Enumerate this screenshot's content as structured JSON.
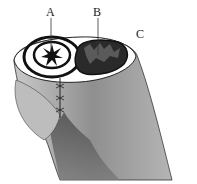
{
  "diagram": {
    "type": "anatomical cross-section illustration",
    "labels": [
      {
        "id": "A",
        "text": "A",
        "target": "central star-shaped lumen within left ring"
      },
      {
        "id": "B",
        "text": "B",
        "target": "dark spongy tissue within right chamber"
      },
      {
        "id": "C",
        "text": "C",
        "target": "outer body region"
      }
    ]
  }
}
